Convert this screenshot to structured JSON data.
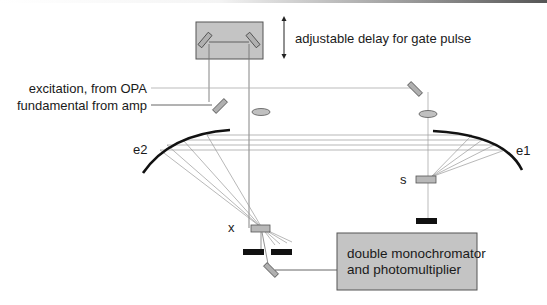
{
  "diagram": {
    "type": "optical-setup",
    "labels": {
      "delay": "adjustable delay for gate pulse",
      "excitation": "excitation, from OPA",
      "fundamental": "fundamental from amp",
      "mirror_e1": "e1",
      "mirror_e2": "e2",
      "sample": "s",
      "crystal": "x",
      "detector_line1": "double monochromator",
      "detector_line2": "and photomultiplier"
    },
    "colors": {
      "component_fill": "#c0c0c0",
      "component_stroke": "#555555",
      "beam": "#888888",
      "mirror_curve": "#111111",
      "beam_block": "#111111"
    },
    "components": [
      {
        "id": "delay-stage",
        "kind": "translation stage with two mirrors"
      },
      {
        "id": "fundamental-mirror",
        "kind": "flat mirror"
      },
      {
        "id": "excitation-mirror",
        "kind": "flat mirror"
      },
      {
        "id": "lens-gate",
        "kind": "lens"
      },
      {
        "id": "lens-excitation",
        "kind": "lens"
      },
      {
        "id": "ellipsoidal-mirror-e1",
        "kind": "ellipsoidal mirror"
      },
      {
        "id": "ellipsoidal-mirror-e2",
        "kind": "ellipsoidal mirror"
      },
      {
        "id": "sample",
        "kind": "sample"
      },
      {
        "id": "sum-frequency-crystal",
        "kind": "crystal"
      },
      {
        "id": "beam-blocks",
        "kind": "beam dump"
      },
      {
        "id": "pickoff-mirror",
        "kind": "flat mirror"
      },
      {
        "id": "detector",
        "kind": "double monochromator and photomultiplier"
      }
    ]
  }
}
